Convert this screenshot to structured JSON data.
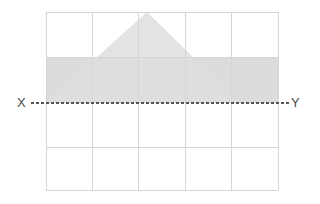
{
  "figure": {
    "title": "",
    "labels": {
      "x_label": "X",
      "y_label": "Y"
    },
    "colors": {
      "grid_line": "#d5d5d5",
      "grid_border": "#cfcfcf",
      "triangle_fill": "#dedede",
      "rectangle_fill": "#dcdcdc",
      "overlap_fill": "#cfcfcf",
      "axis_line": "#5a5a5a",
      "label_text": "#4a4a4a",
      "background": "#ffffff"
    },
    "grid": {
      "columns": 5,
      "rows": 4,
      "left": 46,
      "top": 12,
      "right": 278,
      "bottom": 190,
      "cell_width": 46.4,
      "cell_height": 44.5,
      "x_lines": [
        46,
        92.4,
        138.8,
        185.2,
        231.6,
        278
      ],
      "y_lines": [
        12,
        56.5,
        101,
        145.5,
        190
      ]
    },
    "axis": {
      "style": "dashed",
      "y": 103,
      "x_start": 31,
      "x_end": 289,
      "dash_pattern": "3 2"
    },
    "shapes": [
      {
        "name": "shaded-rectangle",
        "type": "rectangle",
        "x": 46,
        "y": 57,
        "width": 232,
        "height": 46,
        "fill": "#dcdcdc"
      },
      {
        "name": "triangle",
        "type": "triangle",
        "points": "46,103 147,12 240,103",
        "apex": [
          147,
          12
        ],
        "base_left": [
          46,
          103
        ],
        "base_right": [
          240,
          103
        ],
        "fill": "#dedede"
      }
    ]
  }
}
